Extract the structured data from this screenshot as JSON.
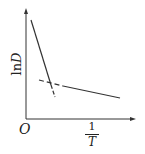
{
  "diagram": {
    "type": "arrhenius-plot",
    "y_axis": {
      "label_prefix": "ln",
      "label_var": "D"
    },
    "x_axis": {
      "label_numerator": "1",
      "label_denominator": "T"
    },
    "origin_label": "O",
    "lines": [
      {
        "name": "steep-segment",
        "style": "solid",
        "from": [
          31,
          20
        ],
        "to": [
          51,
          85
        ]
      },
      {
        "name": "steep-segment-dashed-extension",
        "style": "dashed",
        "from": [
          51,
          85
        ],
        "to": [
          55,
          97
        ]
      },
      {
        "name": "shallow-segment-dashed-extension",
        "style": "dashed",
        "from": [
          39,
          80
        ],
        "to": [
          63,
          86
        ]
      },
      {
        "name": "shallow-segment",
        "style": "solid",
        "from": [
          63,
          86
        ],
        "to": [
          120,
          98
        ]
      }
    ],
    "colors": {
      "line": "#333333",
      "axis": "#333333",
      "text": "#222222"
    }
  }
}
